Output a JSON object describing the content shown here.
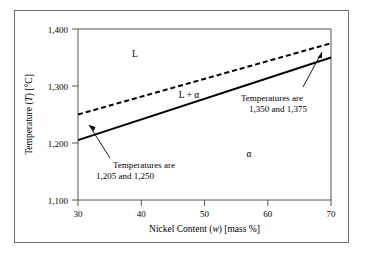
{
  "figure": {
    "background_color": "#ffffff",
    "frame_color": "#6b6b6b",
    "axis_color": "#555555",
    "line_color": "#000000"
  },
  "chart_data": {
    "type": "line",
    "title": "",
    "xlabel_text": "Nickel Content (w) [mass %]",
    "xlabel_pre": "Nickel Content (",
    "xlabel_var": "w",
    "xlabel_post": ") [mass %]",
    "ylabel_text": "Temperature (T) [°C]",
    "ylabel_pre": "Temperature (",
    "ylabel_var": "T",
    "ylabel_post": ") [°C]",
    "xlim": [
      30,
      70
    ],
    "ylim": [
      1100,
      1400
    ],
    "xticks": [
      30,
      40,
      50,
      60,
      70
    ],
    "xtick_labels": [
      "30",
      "40",
      "50",
      "60",
      "70"
    ],
    "yticks": [
      1100,
      1200,
      1300,
      1400
    ],
    "ytick_labels": [
      "1,100",
      "1,200",
      "1,300",
      "1,400"
    ],
    "grid": false,
    "legend": "none",
    "series": [
      {
        "name": "Liquidus",
        "style": "dashed",
        "color": "#000000",
        "x": [
          30,
          70
        ],
        "values": [
          1250,
          1375
        ]
      },
      {
        "name": "Solidus",
        "style": "solid",
        "color": "#000000",
        "x": [
          30,
          70
        ],
        "values": [
          1205,
          1350
        ]
      }
    ],
    "region_labels": [
      {
        "name": "liquid",
        "text": "L",
        "x": 39,
        "y": 1355
      },
      {
        "name": "liquid-plus-alpha",
        "text": "L + α",
        "x": 47.5,
        "y": 1283
      },
      {
        "name": "alpha",
        "text": "α",
        "x": 57,
        "y": 1180
      }
    ],
    "annotations": [
      {
        "name": "left-annotation",
        "line1": "Temperatures are",
        "line2": "1,205 and 1,250",
        "points_to_x": 31.5,
        "points_to_y": 1228
      },
      {
        "name": "right-annotation",
        "line1": "Temperatures are",
        "line2": "1,350 and 1,375",
        "points_to_x": 69,
        "points_to_y": 1362
      }
    ]
  }
}
